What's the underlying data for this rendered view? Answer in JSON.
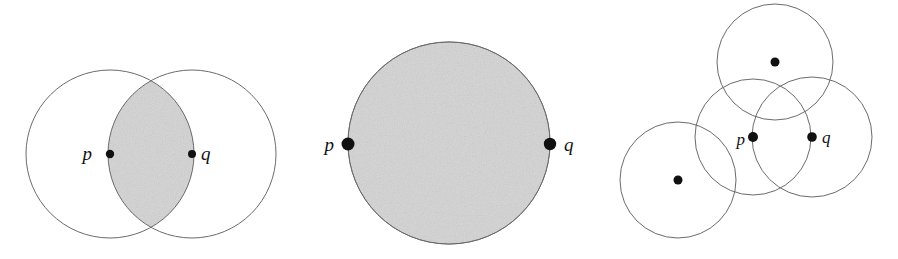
{
  "figure": {
    "background_color": "#ffffff",
    "outline_color": "#6b6b6b",
    "fill_color": "#d4d4d4",
    "dot_color": "#111111",
    "width": 898,
    "height": 259,
    "panels": [
      {
        "id": "panel-left",
        "name": "two-overlapping-disks-with-lens",
        "filled": true,
        "circles": [
          {
            "name": "circle-p",
            "cx": 110,
            "cy": 154,
            "r": 84,
            "filled": false
          },
          {
            "name": "circle-q",
            "cx": 192,
            "cy": 154,
            "r": 84,
            "filled": false
          }
        ],
        "shaded_region": "lens-intersection",
        "points": [
          {
            "name": "point-p",
            "label": "p",
            "cx": 110,
            "cy": 154,
            "r": 4.2,
            "label_x": 92,
            "label_y": 160
          },
          {
            "name": "point-q",
            "label": "q",
            "cx": 192,
            "cy": 154,
            "r": 4.0,
            "label_x": 201,
            "label_y": 160
          }
        ]
      },
      {
        "id": "panel-middle",
        "name": "single-filled-disk-with-antipodal-points",
        "filled": true,
        "circles": [
          {
            "name": "circle-main",
            "cx": 449,
            "cy": 143,
            "r": 101,
            "filled": true
          }
        ],
        "shaded_region": "whole-disk",
        "points": [
          {
            "name": "point-p",
            "label": "p",
            "cx": 348,
            "cy": 144,
            "r": 6.5,
            "label_x": 322,
            "label_y": 151
          },
          {
            "name": "point-q",
            "label": "q",
            "cx": 550,
            "cy": 144,
            "r": 6.2,
            "label_x": 563,
            "label_y": 151
          }
        ]
      },
      {
        "id": "panel-right",
        "name": "four-overlapping-unfilled-disks",
        "filled": false,
        "circles": [
          {
            "name": "circle-top",
            "cx": 775,
            "cy": 62,
            "r": 58,
            "filled": false
          },
          {
            "name": "circle-lower-left",
            "cx": 678,
            "cy": 180,
            "r": 58,
            "filled": false
          },
          {
            "name": "circle-p",
            "cx": 753,
            "cy": 137,
            "r": 58,
            "filled": false
          },
          {
            "name": "circle-q",
            "cx": 812,
            "cy": 137,
            "r": 60,
            "filled": false
          }
        ],
        "shaded_region": "none",
        "points": [
          {
            "name": "point-top-center",
            "label": "",
            "cx": 775,
            "cy": 62,
            "r": 4.5,
            "label_x": 0,
            "label_y": 0
          },
          {
            "name": "point-lower-left-center",
            "label": "",
            "cx": 678,
            "cy": 180,
            "r": 4.5,
            "label_x": 0,
            "label_y": 0
          },
          {
            "name": "point-p",
            "label": "p",
            "cx": 753,
            "cy": 137,
            "r": 5.0,
            "label_x": 735,
            "label_y": 145
          },
          {
            "name": "point-q",
            "label": "q",
            "cx": 812,
            "cy": 137,
            "r": 4.8,
            "label_x": 822,
            "label_y": 143
          }
        ]
      }
    ]
  }
}
